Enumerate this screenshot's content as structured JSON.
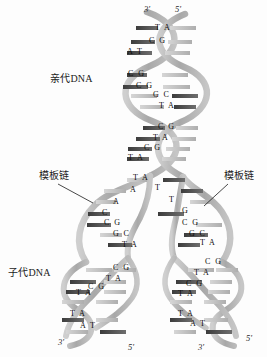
{
  "figure": {
    "colors": {
      "backbone_light": "#b8b8b8",
      "backbone_mid": "#9a9a9a",
      "rung_dark": "#4f4f4f",
      "rung_light": "#c9c9c9",
      "text": "#111111",
      "background": "#fdfdfd"
    }
  },
  "labels": {
    "parent_dna": "亲代DNA",
    "daughter_dna": "子代DNA",
    "template_strand_left": "模板链",
    "template_strand_right": "模板链"
  },
  "termini": {
    "top_left": "3'",
    "top_right": "5'",
    "bottom_left_left": "3'",
    "bottom_left_right": "5'",
    "bottom_right_left": "3'",
    "bottom_right_right": "5'"
  },
  "base_pairs": {
    "parent_segment_1": [
      {
        "left": "T",
        "right": "A"
      },
      {
        "left": "C",
        "right": "G"
      },
      {
        "left": "A",
        "right": "T"
      }
    ],
    "parent_segment_2": [
      {
        "left": "C",
        "right": "G"
      },
      {
        "left": "C",
        "right": "G"
      },
      {
        "left": "G",
        "right": "C"
      },
      {
        "left": "T",
        "right": "A"
      }
    ],
    "parent_segment_3": [
      {
        "left": "C",
        "right": "G"
      },
      {
        "left": "T",
        "right": "A"
      },
      {
        "left": "C",
        "right": "G"
      },
      {
        "left": "T",
        "right": "A"
      }
    ],
    "fork_junction": [
      {
        "left": "T",
        "right": "A"
      }
    ],
    "fork_unpaired_left": [
      "A",
      "A",
      "C"
    ],
    "fork_unpaired_right": [
      "T",
      "T",
      "G"
    ],
    "daughter_left_upper": [
      {
        "left": "C",
        "right": "G"
      },
      {
        "left": "G",
        "right": "C"
      },
      {
        "left": "T",
        "right": "A"
      }
    ],
    "daughter_left_lower": [
      {
        "left": "C",
        "right": "G"
      },
      {
        "left": "T",
        "right": "A"
      },
      {
        "left": "C",
        "right": "G"
      },
      {
        "left": "T",
        "right": "A"
      }
    ],
    "daughter_left_end": [
      {
        "left": "T",
        "right": "A"
      },
      {
        "left": "A",
        "right": "T"
      }
    ],
    "daughter_right_upper": [
      {
        "left": "C",
        "right": "G"
      },
      {
        "left": "G",
        "right": "C"
      },
      {
        "left": "T",
        "right": "A"
      }
    ],
    "daughter_right_lower": [
      {
        "left": "C",
        "right": "G"
      },
      {
        "left": "T",
        "right": "A"
      },
      {
        "left": "C",
        "right": "G"
      },
      {
        "left": "T",
        "right": "A"
      }
    ],
    "daughter_right_end": [
      {
        "left": "T",
        "right": "A"
      },
      {
        "left": "A",
        "right": "T"
      }
    ]
  },
  "base_text": {
    "p1_r1": "T A",
    "p1_r2": "C G",
    "p1_r3": "A T",
    "p2_r1": "C G",
    "p2_r2": "C G",
    "p2_r3": "G C",
    "p2_r4": "T A",
    "p3_r1": "C G",
    "p3_r2": "T A",
    "p3_r3": "C G",
    "p3_r4": "T A",
    "fork_r1": "T A",
    "fl_1": "A",
    "fl_2": "A",
    "fl_3": "C",
    "fr_1": "T",
    "fr_2": "T",
    "fr_3": "G",
    "dlu_1": "C G",
    "dlu_2": "G C",
    "dlu_3": "T A",
    "dll_1": "C G",
    "dll_2": "T A",
    "dll_3": "C G",
    "dll_4": "T A",
    "dle_1": "T A",
    "dle_2": "A T",
    "dru_1": "C G",
    "dru_2": "G C",
    "dru_3": "T A",
    "drl_1": "C G",
    "drl_2": "T A",
    "drl_3": "C G",
    "drl_4": "T A",
    "dre_1": "T A",
    "dre_2": "A T"
  }
}
